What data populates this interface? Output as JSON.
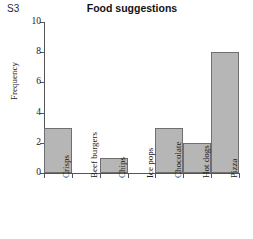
{
  "corner_label": "S3",
  "chart_data": {
    "type": "bar",
    "title": "Food suggestions",
    "xlabel": "",
    "ylabel": "Frequency",
    "categories": [
      "Crisps",
      "Beef burgers",
      "Chips",
      "Ice pops",
      "Chocolate",
      "Hot dogs",
      "Pizza"
    ],
    "values": [
      3,
      0,
      1,
      0,
      3,
      2,
      8
    ],
    "ylim": [
      0,
      10
    ],
    "yticks": [
      0,
      2,
      4,
      6,
      8,
      10
    ],
    "ytick_labels": [
      "0",
      "2",
      "4",
      "6",
      "8",
      "10"
    ],
    "grid": false,
    "legend": "none",
    "bar_fill_color": "#b6b6b6",
    "bar_edge_color": "#6f6f6f",
    "axis_color": "#555555",
    "xtick_label_rotation": 90
  }
}
